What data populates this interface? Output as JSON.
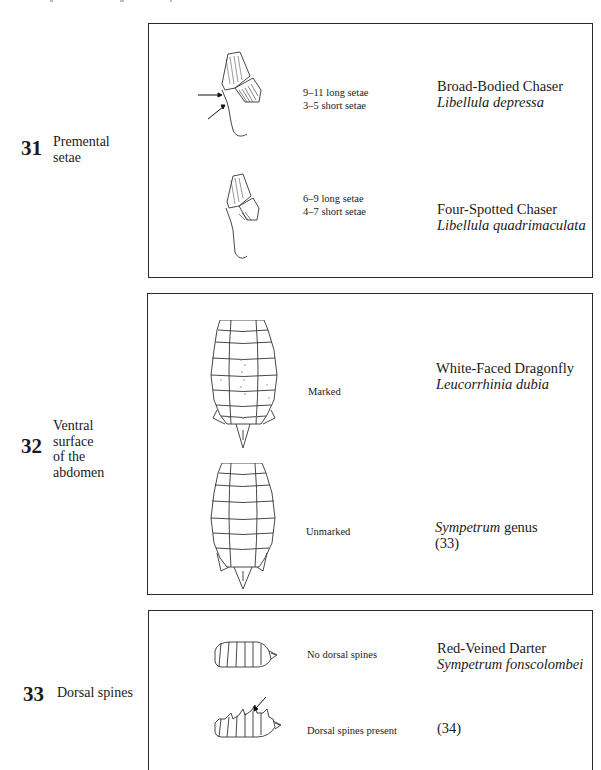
{
  "couplets": [
    {
      "number": "31",
      "character": "Premental\nsetae",
      "options": [
        {
          "figure": "prementum-with-arrows",
          "feature": "9–11 long setae\n3–5 short setae",
          "common_name": "Broad-Bodied Chaser",
          "latin_name": "Libellula depressa",
          "latin_suffix": "",
          "reference": ""
        },
        {
          "figure": "prementum",
          "feature": "6–9 long setae\n4–7 short setae",
          "common_name": "Four-Spotted Chaser",
          "latin_name": "Libellula quadrimaculata",
          "latin_suffix": "",
          "reference": ""
        }
      ]
    },
    {
      "number": "32",
      "character": "Ventral\nsurface\nof the\nabdomen",
      "options": [
        {
          "figure": "abdomen-ventral-marked",
          "feature": "Marked",
          "common_name": "White-Faced Dragonfly",
          "latin_name": "Leucorrhinia dubia",
          "latin_suffix": "",
          "reference": ""
        },
        {
          "figure": "abdomen-ventral-unmarked",
          "feature": "Unmarked",
          "common_name": "",
          "latin_name": "Sympetrum",
          "latin_suffix": " genus",
          "reference": "(33)"
        }
      ]
    },
    {
      "number": "33",
      "character": "Dorsal spines",
      "options": [
        {
          "figure": "abdomen-lateral-no-spines",
          "feature": "No dorsal spines",
          "common_name": "Red-Veined Darter",
          "latin_name": "Sympetrum fonscolombei",
          "latin_suffix": "",
          "reference": ""
        },
        {
          "figure": "abdomen-lateral-spines",
          "feature": "Dorsal spines present",
          "common_name": "",
          "latin_name": "",
          "latin_suffix": "",
          "reference": "(34)"
        }
      ]
    }
  ]
}
